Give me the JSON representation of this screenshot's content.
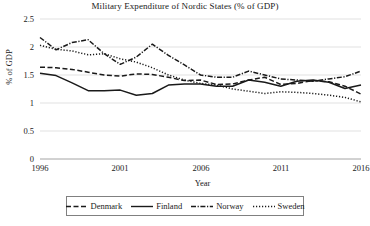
{
  "chart_data": {
    "type": "line",
    "title": "Military Expenditure of Nordic States (% of GDP)",
    "xlabel": "Year",
    "ylabel": "% of GDP",
    "grid": true,
    "legend_position": "bottom",
    "xlim": [
      1996,
      2016
    ],
    "ylim": [
      0,
      2.5
    ],
    "yticks": [
      "0",
      "0.5",
      "1",
      "1.5",
      "2",
      "2.5"
    ],
    "ytick_values": [
      0,
      0.5,
      1,
      1.5,
      2,
      2.5
    ],
    "xticks": [
      "1996",
      "2001",
      "2006",
      "2011",
      "2016"
    ],
    "xtick_values": [
      1996,
      2001,
      2006,
      2011,
      2016
    ],
    "x": [
      1996,
      1997,
      1998,
      1999,
      2000,
      2001,
      2002,
      2003,
      2004,
      2005,
      2006,
      2007,
      2008,
      2009,
      2010,
      2011,
      2012,
      2013,
      2014,
      2015,
      2016
    ],
    "series": [
      {
        "name": "Denmark",
        "style": "dashed",
        "color": "#1a1a1a",
        "values": [
          1.64,
          1.63,
          1.6,
          1.55,
          1.5,
          1.48,
          1.52,
          1.51,
          1.46,
          1.4,
          1.41,
          1.33,
          1.34,
          1.41,
          1.46,
          1.33,
          1.35,
          1.4,
          1.38,
          1.3,
          1.16
        ]
      },
      {
        "name": "Finland",
        "style": "solid",
        "color": "#1a1a1a",
        "values": [
          1.53,
          1.49,
          1.36,
          1.22,
          1.22,
          1.23,
          1.14,
          1.17,
          1.32,
          1.34,
          1.34,
          1.3,
          1.3,
          1.41,
          1.37,
          1.3,
          1.39,
          1.41,
          1.37,
          1.26,
          1.32
        ]
      },
      {
        "name": "Norway",
        "style": "dash-dot",
        "color": "#1a1a1a",
        "values": [
          2.17,
          1.95,
          2.08,
          2.13,
          1.88,
          1.69,
          1.82,
          2.05,
          1.85,
          1.68,
          1.5,
          1.46,
          1.46,
          1.57,
          1.5,
          1.43,
          1.41,
          1.39,
          1.43,
          1.47,
          1.57
        ]
      },
      {
        "name": "Sweden",
        "style": "dotted",
        "color": "#1a1a1a",
        "values": [
          2.03,
          1.96,
          1.93,
          1.86,
          1.88,
          1.79,
          1.73,
          1.63,
          1.5,
          1.41,
          1.35,
          1.32,
          1.25,
          1.21,
          1.17,
          1.2,
          1.19,
          1.17,
          1.14,
          1.1,
          1.02
        ]
      }
    ]
  },
  "legend": {
    "items": [
      {
        "label": "Denmark"
      },
      {
        "label": "Finland"
      },
      {
        "label": "Norway"
      },
      {
        "label": "Sweden"
      }
    ]
  }
}
